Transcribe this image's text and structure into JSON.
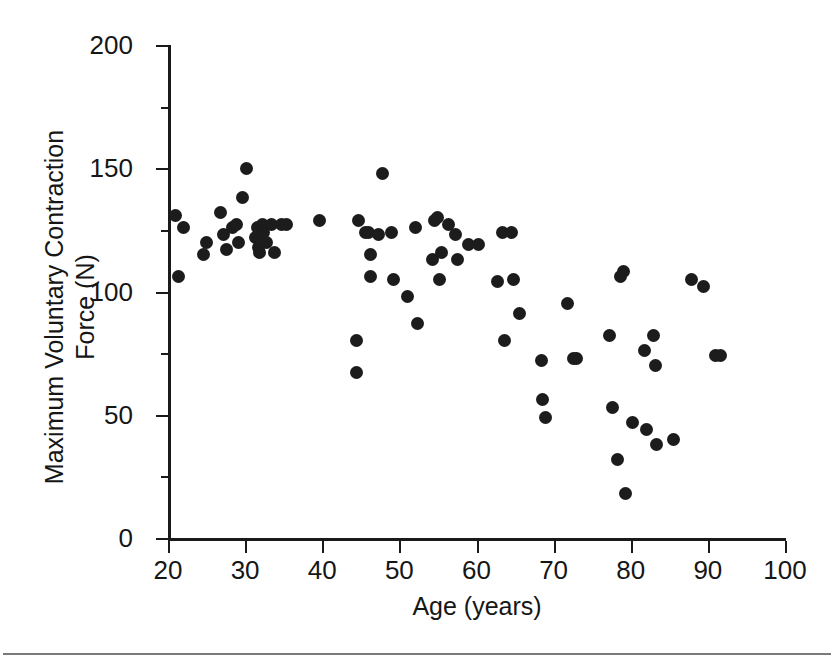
{
  "chart_data": {
    "type": "scatter",
    "title": "",
    "xlabel": "Age (years)",
    "ylabel": "Maximum Voluntary Contraction\nForce (N)",
    "xlim": [
      20,
      100
    ],
    "ylim": [
      0,
      200
    ],
    "xticks": [
      20,
      30,
      40,
      50,
      60,
      70,
      80,
      90,
      100
    ],
    "yticks": [
      0,
      50,
      100,
      150,
      200
    ],
    "xtick_labels": [
      "20",
      "30",
      "40",
      "50",
      "60",
      "70",
      "80",
      "90",
      "100"
    ],
    "ytick_labels": [
      "0",
      "50",
      "100",
      "150",
      "200"
    ],
    "grid": false,
    "legend": null,
    "marker": "filled-circle",
    "marker_color": "#1c1c1c",
    "n_points": 76,
    "points": [
      {
        "x": 21.0,
        "y": 131
      },
      {
        "x": 21.3,
        "y": 106
      },
      {
        "x": 22.0,
        "y": 126
      },
      {
        "x": 24.6,
        "y": 115
      },
      {
        "x": 25.0,
        "y": 120
      },
      {
        "x": 26.8,
        "y": 132
      },
      {
        "x": 27.2,
        "y": 123
      },
      {
        "x": 27.6,
        "y": 117
      },
      {
        "x": 28.4,
        "y": 126
      },
      {
        "x": 28.9,
        "y": 127
      },
      {
        "x": 29.1,
        "y": 120
      },
      {
        "x": 29.6,
        "y": 138
      },
      {
        "x": 30.2,
        "y": 150
      },
      {
        "x": 31.4,
        "y": 122
      },
      {
        "x": 31.6,
        "y": 126
      },
      {
        "x": 31.7,
        "y": 118
      },
      {
        "x": 31.9,
        "y": 116
      },
      {
        "x": 32.2,
        "y": 127
      },
      {
        "x": 32.4,
        "y": 124
      },
      {
        "x": 32.8,
        "y": 120
      },
      {
        "x": 33.4,
        "y": 127
      },
      {
        "x": 33.8,
        "y": 116
      },
      {
        "x": 34.7,
        "y": 127
      },
      {
        "x": 35.4,
        "y": 127
      },
      {
        "x": 39.6,
        "y": 129
      },
      {
        "x": 44.4,
        "y": 80
      },
      {
        "x": 44.5,
        "y": 67
      },
      {
        "x": 44.7,
        "y": 129
      },
      {
        "x": 45.6,
        "y": 124
      },
      {
        "x": 46.0,
        "y": 124
      },
      {
        "x": 46.2,
        "y": 115
      },
      {
        "x": 46.3,
        "y": 106
      },
      {
        "x": 47.3,
        "y": 123
      },
      {
        "x": 47.8,
        "y": 148
      },
      {
        "x": 49.0,
        "y": 124
      },
      {
        "x": 49.3,
        "y": 105
      },
      {
        "x": 51.0,
        "y": 98
      },
      {
        "x": 52.1,
        "y": 126
      },
      {
        "x": 52.4,
        "y": 87
      },
      {
        "x": 54.3,
        "y": 113
      },
      {
        "x": 54.5,
        "y": 129
      },
      {
        "x": 54.9,
        "y": 130
      },
      {
        "x": 55.2,
        "y": 105
      },
      {
        "x": 55.5,
        "y": 116
      },
      {
        "x": 56.4,
        "y": 127
      },
      {
        "x": 57.3,
        "y": 123
      },
      {
        "x": 57.6,
        "y": 113
      },
      {
        "x": 58.9,
        "y": 119
      },
      {
        "x": 60.3,
        "y": 119
      },
      {
        "x": 62.7,
        "y": 104
      },
      {
        "x": 63.4,
        "y": 124
      },
      {
        "x": 63.6,
        "y": 80
      },
      {
        "x": 64.5,
        "y": 124
      },
      {
        "x": 64.8,
        "y": 105
      },
      {
        "x": 65.6,
        "y": 91
      },
      {
        "x": 68.4,
        "y": 72
      },
      {
        "x": 68.6,
        "y": 56
      },
      {
        "x": 68.9,
        "y": 49
      },
      {
        "x": 71.8,
        "y": 95
      },
      {
        "x": 72.6,
        "y": 73
      },
      {
        "x": 73.0,
        "y": 73
      },
      {
        "x": 77.3,
        "y": 82
      },
      {
        "x": 77.6,
        "y": 53
      },
      {
        "x": 78.3,
        "y": 32
      },
      {
        "x": 78.7,
        "y": 106
      },
      {
        "x": 79.1,
        "y": 108
      },
      {
        "x": 79.3,
        "y": 18
      },
      {
        "x": 80.2,
        "y": 47
      },
      {
        "x": 81.8,
        "y": 76
      },
      {
        "x": 82.1,
        "y": 44
      },
      {
        "x": 83.0,
        "y": 82
      },
      {
        "x": 83.2,
        "y": 70
      },
      {
        "x": 83.4,
        "y": 38
      },
      {
        "x": 85.6,
        "y": 40
      },
      {
        "x": 87.9,
        "y": 105
      },
      {
        "x": 89.4,
        "y": 102
      },
      {
        "x": 91.0,
        "y": 74
      },
      {
        "x": 91.6,
        "y": 74
      }
    ]
  }
}
